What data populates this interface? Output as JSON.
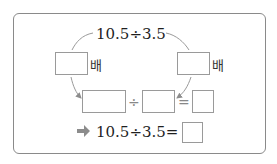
{
  "top_expression": "10.5÷3.5",
  "left_multiplier": {
    "value": "",
    "unit": "배"
  },
  "right_multiplier": {
    "value": "",
    "unit": "배"
  },
  "equation_row": {
    "dividend": "",
    "operator_divide": "÷",
    "divisor": "",
    "operator_equals": "=",
    "quotient": ""
  },
  "result_row": {
    "arrow_icon": "right-arrow-icon",
    "expression": "10.5÷3.5=",
    "answer": ""
  },
  "colors": {
    "arrow": "#8c8c8c",
    "box_border": "#9a9a9a",
    "frame_border": "#8a8a8a"
  }
}
